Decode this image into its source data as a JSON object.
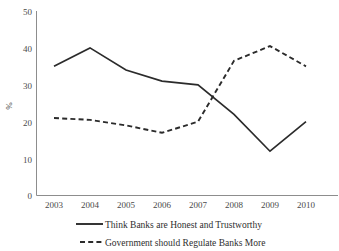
{
  "chart_data": {
    "type": "line",
    "title": "",
    "xlabel": "",
    "ylabel": "%",
    "categories": [
      "2003",
      "2004",
      "2005",
      "2006",
      "2007",
      "2008",
      "2009",
      "2010"
    ],
    "ylim": [
      0,
      50
    ],
    "yticks": [
      0,
      10,
      20,
      30,
      40,
      50
    ],
    "ytick_labels": [
      "0",
      "10",
      "20",
      "30",
      "40",
      "50"
    ],
    "grid": false,
    "legend_position": "bottom",
    "series": [
      {
        "name": "Think Banks are Honest and Trustworthy",
        "style": "solid",
        "color": "#2b2b2b",
        "values": [
          35,
          40,
          34,
          31,
          30,
          22,
          12,
          20
        ]
      },
      {
        "name": "Government should Regulate Banks More",
        "style": "dashed",
        "color": "#2b2b2b",
        "values": [
          21,
          20.5,
          19,
          17,
          20,
          36.5,
          40.5,
          35
        ]
      }
    ]
  },
  "axis": {
    "y_title": "%",
    "y_labels": {
      "t0": "0",
      "t1": "10",
      "t2": "20",
      "t3": "30",
      "t4": "40",
      "t5": "50"
    },
    "x_labels": {
      "c0": "2003",
      "c1": "2004",
      "c2": "2005",
      "c3": "2006",
      "c4": "2007",
      "c5": "2008",
      "c6": "2009",
      "c7": "2010"
    }
  },
  "legend": {
    "entry1": "Think Banks are Honest and Trustworthy",
    "entry2": "Government should Regulate Banks More"
  }
}
